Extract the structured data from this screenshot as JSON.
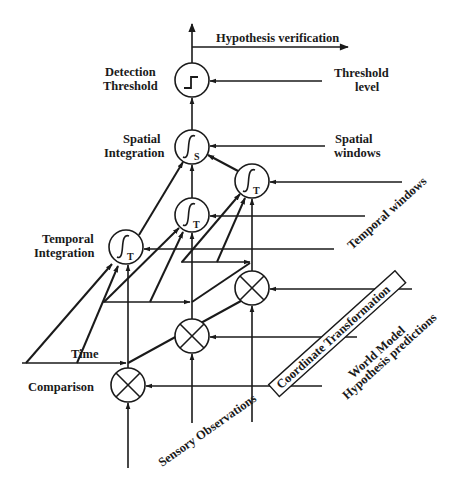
{
  "diagram": {
    "labels": {
      "hypothesis_verification": "Hypothesis verification",
      "detection_threshold_1": "Detection",
      "detection_threshold_2": "Threshold",
      "threshold_level_1": "Threshold",
      "threshold_level_2": "level",
      "spatial_integration_1": "Spatial",
      "spatial_integration_2": "Integration",
      "spatial_windows_1": "Spatial",
      "spatial_windows_2": "windows",
      "temporal_windows": "Temporal windows",
      "temporal_integration_1": "Temporal",
      "temporal_integration_2": "Integration",
      "time": "Time",
      "comparison": "Comparison",
      "sensory_observations": "Sensory Observations",
      "coordinate_transformation": "Coordinate Transformation",
      "world_model": "World Model",
      "hypothesis_predictions": "Hypothesis predictions"
    },
    "nodes": [
      {
        "id": "threshold",
        "type": "step",
        "symbol": "step-function-icon"
      },
      {
        "id": "spatial-integrator",
        "type": "integral",
        "subscript": "S"
      },
      {
        "id": "temporal-integrator-back",
        "type": "integral",
        "subscript": "T"
      },
      {
        "id": "temporal-integrator-middle",
        "type": "integral",
        "subscript": "T"
      },
      {
        "id": "temporal-integrator-front",
        "type": "integral",
        "subscript": "T"
      },
      {
        "id": "comparator-back",
        "type": "multiply"
      },
      {
        "id": "comparator-middle",
        "type": "multiply"
      },
      {
        "id": "comparator-front",
        "type": "multiply"
      }
    ],
    "subscripts": {
      "spatial": "S",
      "temporal": "T"
    },
    "colors": {
      "ink": "#1a1a1a",
      "background": "#ffffff"
    }
  }
}
